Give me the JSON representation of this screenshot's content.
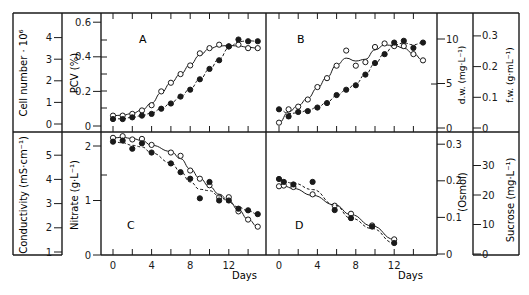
{
  "chart_data": [
    {
      "panel": "A",
      "type": "line",
      "xlabel": "Days",
      "x_ticks": [
        0,
        4,
        8,
        12
      ],
      "x_range": [
        -1,
        16
      ],
      "y_left_axes": [
        {
          "label": "Cell number · 10⁶",
          "ticks": [
            0,
            1,
            2,
            3,
            4
          ]
        },
        {
          "label": "PCV (%)",
          "ticks": [
            0,
            0.2,
            0.4,
            0.6
          ],
          "ylim": [
            0,
            0.6
          ]
        }
      ],
      "series": [
        {
          "name": "open circles",
          "marker": "open",
          "x": [
            0,
            1,
            2,
            3,
            4,
            5,
            6,
            7,
            8,
            9,
            10,
            11,
            12,
            13,
            14,
            15
          ],
          "y": [
            0.06,
            0.06,
            0.07,
            0.09,
            0.12,
            0.2,
            0.25,
            0.3,
            0.35,
            0.42,
            0.45,
            0.47,
            0.46,
            0.47,
            0.45,
            0.45
          ]
        },
        {
          "name": "filled circles",
          "marker": "filled",
          "x": [
            0,
            1,
            2,
            3,
            4,
            5,
            6,
            7,
            8,
            9,
            10,
            11,
            12,
            13,
            14,
            15
          ],
          "y": [
            0.04,
            0.04,
            0.05,
            0.06,
            0.07,
            0.1,
            0.13,
            0.17,
            0.21,
            0.27,
            0.33,
            0.38,
            0.46,
            0.5,
            0.49,
            0.49
          ]
        }
      ]
    },
    {
      "panel": "B",
      "type": "line",
      "xlabel": "Days",
      "x_ticks": [
        0,
        4,
        8,
        12
      ],
      "x_range": [
        -1,
        16
      ],
      "y_right_axes": [
        {
          "label": "d.w. (mg·L⁻¹)",
          "ticks": [
            0,
            5,
            10
          ],
          "ylim": [
            0,
            10.5
          ]
        },
        {
          "label": "f.w. (g·mL⁻¹)",
          "ticks": [
            0,
            0.1,
            0.2,
            0.3
          ],
          "ylim": [
            0,
            0.3
          ]
        }
      ],
      "series": [
        {
          "name": "open circles",
          "marker": "open",
          "x": [
            0,
            1,
            2,
            3,
            4,
            5,
            6,
            7,
            8,
            9,
            10,
            11,
            12,
            13,
            14,
            15
          ],
          "y": [
            0.6,
            2.1,
            2.4,
            3.2,
            4.6,
            5.6,
            7.0,
            8.7,
            7.0,
            7.4,
            9.1,
            9.5,
            9.2,
            9.2,
            8.3,
            7.6
          ]
        },
        {
          "name": "filled circles",
          "marker": "filled",
          "x": [
            0,
            1,
            2,
            3,
            4,
            5,
            6,
            7,
            8,
            9,
            10,
            11,
            12,
            13,
            14,
            15
          ],
          "y": [
            2.1,
            1.3,
            1.8,
            1.9,
            2.3,
            2.8,
            3.7,
            4.3,
            4.8,
            6.0,
            7.3,
            8.3,
            9.6,
            9.8,
            9.0,
            9.6
          ]
        }
      ]
    },
    {
      "panel": "C",
      "type": "line",
      "xlabel": "Days",
      "x_ticks": [
        0,
        4,
        8,
        12
      ],
      "x_range": [
        -1,
        16
      ],
      "y_left_axes": [
        {
          "label": "Conductivity (mS·cm⁻¹)",
          "ticks": [
            1,
            2,
            3,
            4,
            5
          ]
        },
        {
          "label": "Nitrate (g·L⁻¹)",
          "ticks": [
            0,
            1,
            2
          ],
          "ylim": [
            0,
            2.2
          ]
        }
      ],
      "series": [
        {
          "name": "open circles",
          "marker": "open",
          "x": [
            0,
            1,
            2,
            3,
            4,
            6,
            7,
            8,
            9,
            10,
            11,
            12,
            13,
            14,
            15
          ],
          "y": [
            2.15,
            2.18,
            2.12,
            2.13,
            2.02,
            1.88,
            1.82,
            1.55,
            1.4,
            1.28,
            1.06,
            1.06,
            0.8,
            0.65,
            0.52
          ]
        },
        {
          "name": "filled circles",
          "marker": "filled",
          "x": [
            0,
            1,
            2,
            3,
            4,
            6,
            7,
            8,
            9,
            10,
            11,
            12,
            13,
            14,
            15
          ],
          "y": [
            2.08,
            2.1,
            1.95,
            2.05,
            1.88,
            1.68,
            1.52,
            1.4,
            1.04,
            1.34,
            1.0,
            1.0,
            0.85,
            0.82,
            0.75
          ]
        }
      ]
    },
    {
      "panel": "D",
      "type": "line",
      "xlabel": "Days",
      "x_ticks": [
        0,
        4,
        8,
        12
      ],
      "x_range": [
        -1,
        16
      ],
      "y_right_axes": [
        {
          "label": "(Osmol)",
          "ticks": [
            0,
            0.1,
            0.2,
            0.3
          ],
          "ylim": [
            0,
            0.3
          ]
        },
        {
          "label": "Sucrose (mg·L⁻¹)",
          "ticks": [
            0,
            10,
            20,
            30
          ],
          "ylim": [
            0,
            37.5
          ]
        }
      ],
      "series": [
        {
          "name": "open circles",
          "marker": "open",
          "x": [
            0,
            0.5,
            1.5,
            3.5,
            5.8,
            7.5,
            9.7,
            12
          ],
          "y": [
            0.185,
            0.187,
            0.183,
            0.163,
            0.132,
            0.11,
            0.078,
            0.04
          ]
        },
        {
          "name": "filled circles",
          "marker": "filled",
          "x": [
            0,
            0.5,
            1.5,
            3.5,
            5.8,
            7.5,
            9.7,
            12
          ],
          "y": [
            0.205,
            0.197,
            0.19,
            0.197,
            0.12,
            0.098,
            0.075,
            0.03
          ]
        }
      ]
    }
  ],
  "labels": {
    "panel_a": "A",
    "panel_b": "B",
    "panel_c": "C",
    "panel_d": "D",
    "days_left": "Days",
    "days_right": "Days",
    "cell_number": "Cell number · 10⁶",
    "pcv": "PCV (%)",
    "conductivity": "Conductivity (mS·cm⁻¹)",
    "nitrate": "Nitrate (g·L⁻¹)",
    "dw": "d.w. (mg·L⁻¹)",
    "fw": "f.w. (g·mL⁻¹)",
    "osmol": "(Osmol)",
    "sucrose": "Sucrose (mg·L⁻¹)"
  },
  "ticks": {
    "cell_number": [
      "0",
      "1",
      "2",
      "3",
      "4"
    ],
    "pcv": [
      "0",
      "0.2",
      "0.4",
      "0.6"
    ],
    "conductivity": [
      "1",
      "2",
      "3",
      "4",
      "5"
    ],
    "nitrate": [
      "0",
      "1",
      "2"
    ],
    "dw": [
      "0",
      "5",
      "10"
    ],
    "fw": [
      "0",
      "0.1",
      "0.2",
      "0.3"
    ],
    "osmol": [
      "0",
      "0.1",
      "0.2",
      "0.3"
    ],
    "sucrose": [
      "0",
      "10",
      "20",
      "30"
    ],
    "days": [
      "0",
      "4",
      "8",
      "12"
    ]
  }
}
